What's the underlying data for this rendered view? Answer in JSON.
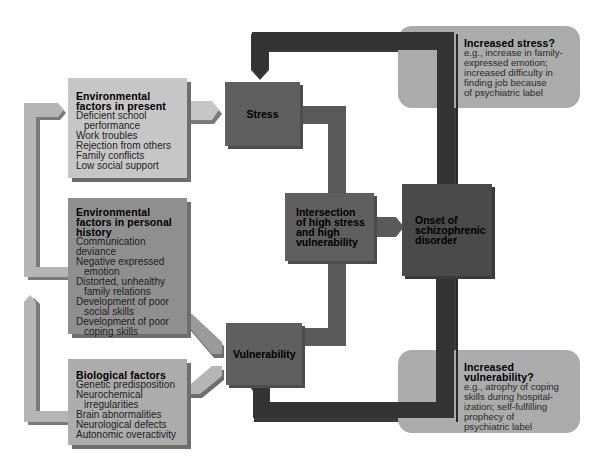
{
  "diagram": {
    "type": "diathesis-stress flow diagram",
    "factors": {
      "present": {
        "title_lines": [
          "Environmental",
          "factors in present"
        ],
        "items": [
          {
            "text": "Deficient school",
            "indent": false
          },
          {
            "text": "performance",
            "indent": true
          },
          {
            "text": "Work troubles",
            "indent": false
          },
          {
            "text": "Rejection from others",
            "indent": false
          },
          {
            "text": "Family conflicts",
            "indent": false
          },
          {
            "text": "Low social support",
            "indent": false
          }
        ]
      },
      "history": {
        "title_lines": [
          "Environmental",
          "factors in personal",
          "history"
        ],
        "items": [
          {
            "text": "Communication deviance",
            "indent": false
          },
          {
            "text": "Negative expressed",
            "indent": false
          },
          {
            "text": "emotion",
            "indent": true
          },
          {
            "text": "Distorted, unhealthy",
            "indent": false
          },
          {
            "text": "family relations",
            "indent": true
          },
          {
            "text": "Development of poor",
            "indent": false
          },
          {
            "text": "social skills",
            "indent": true
          },
          {
            "text": "Development of poor",
            "indent": false
          },
          {
            "text": "coping skills",
            "indent": true
          }
        ]
      },
      "biological": {
        "title_lines": [
          "Biological factors"
        ],
        "items": [
          {
            "text": "Genetic predisposition",
            "indent": false
          },
          {
            "text": "Neurochemical",
            "indent": false
          },
          {
            "text": "irregularities",
            "indent": true
          },
          {
            "text": "Brain abnormalities",
            "indent": false
          },
          {
            "text": "Neurological defects",
            "indent": false
          },
          {
            "text": "Autonomic overactivity",
            "indent": false
          }
        ]
      }
    },
    "nodes": {
      "stress": {
        "lines": [
          "Stress"
        ]
      },
      "vulnerability": {
        "lines": [
          "Vulnerability"
        ]
      },
      "intersection": {
        "lines": [
          "Intersection",
          "of high stress",
          "and high",
          "vulnerability"
        ]
      },
      "onset": {
        "lines": [
          "Onset of",
          "schizophrenic",
          "disorder"
        ]
      }
    },
    "feedback": {
      "stress": {
        "title_lines": [
          "Increased stress?"
        ],
        "desc_lines": [
          "e.g., increase in family-",
          "expressed emotion;",
          "increased difficulty in",
          "finding job because",
          "of psychiatric label"
        ]
      },
      "vulnerability": {
        "title_lines": [
          "Increased",
          "vulnerability?"
        ],
        "desc_lines": [
          "e.g., atrophy of coping",
          "skills during hospital-",
          "ization; self-fulfilling",
          "prophecy of",
          "psychiatric label"
        ]
      }
    },
    "colors": {
      "present_box": "#c6c6c6",
      "history_box": "#8f8f8f",
      "bio_box": "#acacac",
      "node_gray": "#5f5f5f",
      "onset_dark": "#4a4a4a",
      "feedback_arrow": "#3a3a3a",
      "feedback_box": "#ababab",
      "connector_light": "#b5b5b5"
    }
  }
}
